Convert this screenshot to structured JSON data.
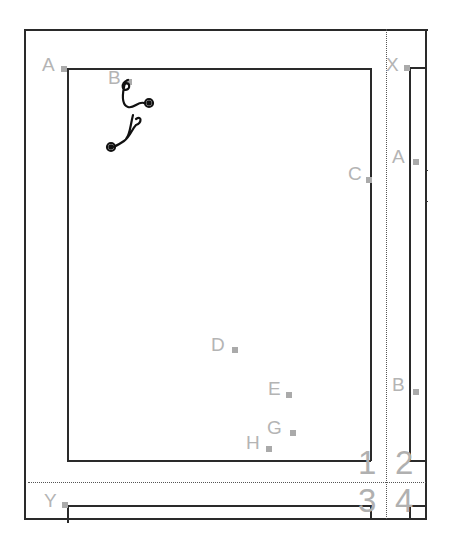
{
  "diagram": {
    "type": "page-layout-template",
    "point_labels": [
      {
        "id": "A",
        "label": "A",
        "x": 42,
        "y": 55
      },
      {
        "id": "B",
        "label": "B",
        "x": 108,
        "y": 68
      },
      {
        "id": "C",
        "label": "C",
        "x": 348,
        "y": 164
      },
      {
        "id": "D",
        "label": "D",
        "x": 211,
        "y": 335
      },
      {
        "id": "E",
        "label": "E",
        "x": 268,
        "y": 379
      },
      {
        "id": "G",
        "label": "G",
        "x": 267,
        "y": 418
      },
      {
        "id": "H",
        "label": "H",
        "x": 246,
        "y": 433
      },
      {
        "id": "X",
        "label": "X",
        "x": 386,
        "y": 55
      },
      {
        "id": "A2",
        "label": "A",
        "x": 392,
        "y": 147
      },
      {
        "id": "B2",
        "label": "B",
        "x": 392,
        "y": 375
      },
      {
        "id": "Y",
        "label": "Y",
        "x": 44,
        "y": 491
      }
    ],
    "quadrant_numbers": [
      {
        "label": "1",
        "x": 358,
        "y": 446
      },
      {
        "label": "2",
        "x": 395,
        "y": 446
      },
      {
        "label": "3",
        "x": 358,
        "y": 484
      },
      {
        "label": "4",
        "x": 395,
        "y": 484
      }
    ],
    "ornament": "calligraphic-flourish",
    "colors": {
      "line": "#2a2a2a",
      "label": "#b4b4b4",
      "marker": "#aaaaaa",
      "background": "#ffffff"
    }
  }
}
